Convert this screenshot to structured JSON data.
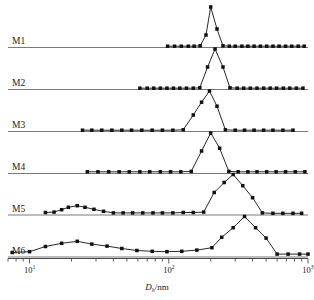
{
  "chart_data": {
    "type": "line",
    "title": "",
    "subtitle": "",
    "xlabel": "D_h/nm",
    "xlabel_base": "D",
    "xlabel_sub": "h",
    "xlabel_unit": "/nm",
    "ylabel": "",
    "xscale": "log",
    "xlim": [
      7,
      1000
    ],
    "grid": false,
    "legend": "none",
    "legend_position": "left-row-labels",
    "marker": "filled-square",
    "line_color": "#111111",
    "baseline_color": "#7a7a7a",
    "axis_color": "#4a4a4a",
    "xticks_major": [
      10,
      100,
      1000
    ],
    "xtick_labels": [
      "10¹",
      "10²",
      "10³"
    ],
    "xtick_label_bases": [
      "10",
      "10",
      "10"
    ],
    "xtick_label_exponents": [
      "1",
      "2",
      "3"
    ],
    "series": [
      {
        "name": "M1",
        "x": [
          98,
          110,
          123,
          138,
          152,
          168,
          185,
          200,
          222,
          245,
          272,
          300,
          335,
          370,
          410,
          455,
          505,
          560,
          620,
          690,
          765,
          850,
          940
        ],
        "values": [
          0.02,
          0.02,
          0.02,
          0.02,
          0.02,
          0.03,
          0.3,
          1.0,
          0.45,
          0.03,
          0.02,
          0.02,
          0.02,
          0.02,
          0.02,
          0.02,
          0.02,
          0.02,
          0.02,
          0.02,
          0.02,
          0.02,
          0.02
        ]
      },
      {
        "name": "M2",
        "x": [
          62,
          70,
          78,
          87,
          97,
          108,
          120,
          134,
          150,
          167,
          190,
          215,
          245,
          275,
          310,
          345,
          385,
          430,
          480,
          535,
          595,
          665,
          740,
          825,
          920
        ],
        "values": [
          0.02,
          0.02,
          0.02,
          0.02,
          0.02,
          0.02,
          0.02,
          0.02,
          0.02,
          0.03,
          0.55,
          1.0,
          0.55,
          0.03,
          0.02,
          0.02,
          0.02,
          0.02,
          0.02,
          0.02,
          0.02,
          0.02,
          0.02,
          0.02,
          0.02
        ]
      },
      {
        "name": "M3",
        "x": [
          24,
          28,
          33,
          39,
          46,
          54,
          64,
          76,
          90,
          107,
          127,
          150,
          172,
          196,
          222,
          255,
          300,
          350,
          410,
          480,
          560,
          660,
          780
        ],
        "values": [
          0.02,
          0.02,
          0.02,
          0.02,
          0.02,
          0.02,
          0.02,
          0.02,
          0.02,
          0.02,
          0.03,
          0.4,
          0.72,
          1.0,
          0.62,
          0.03,
          0.02,
          0.02,
          0.02,
          0.02,
          0.02,
          0.02,
          0.02
        ]
      },
      {
        "name": "M4",
        "x": [
          26,
          31,
          37,
          44,
          52,
          62,
          73,
          87,
          103,
          122,
          145,
          172,
          200,
          232,
          270,
          315,
          370,
          430,
          505,
          590,
          690,
          810,
          950
        ],
        "values": [
          0.03,
          0.03,
          0.03,
          0.03,
          0.03,
          0.03,
          0.03,
          0.03,
          0.03,
          0.03,
          0.04,
          0.55,
          1.0,
          0.62,
          0.04,
          0.03,
          0.03,
          0.03,
          0.03,
          0.03,
          0.03,
          0.03,
          0.03
        ]
      },
      {
        "name": "M5",
        "x": [
          13,
          15,
          17,
          19,
          22,
          25,
          29,
          34,
          40,
          47,
          55,
          65,
          77,
          90,
          107,
          127,
          150,
          178,
          212,
          250,
          290,
          340,
          400,
          470,
          560,
          660,
          780,
          900
        ],
        "values": [
          0.05,
          0.06,
          0.12,
          0.18,
          0.22,
          0.18,
          0.13,
          0.08,
          0.04,
          0.04,
          0.04,
          0.04,
          0.04,
          0.04,
          0.04,
          0.05,
          0.05,
          0.06,
          0.55,
          0.8,
          1.0,
          0.72,
          0.42,
          0.04,
          0.03,
          0.03,
          0.03,
          0.03
        ]
      },
      {
        "name": "M6",
        "x": [
          7.5,
          10,
          13,
          17,
          22,
          28,
          36,
          46,
          59,
          76,
          97,
          124,
          159,
          204,
          240,
          290,
          350,
          420,
          500,
          600,
          720,
          870,
          1000
        ],
        "values": [
          0.1,
          0.12,
          0.25,
          0.33,
          0.38,
          0.31,
          0.26,
          0.2,
          0.15,
          0.13,
          0.12,
          0.13,
          0.16,
          0.22,
          0.48,
          0.72,
          1.0,
          0.72,
          0.46,
          0.06,
          0.06,
          0.06,
          0.06
        ]
      }
    ]
  },
  "axis": {
    "title_base": "D",
    "title_sub": "h",
    "title_unit": "/nm"
  },
  "row_labels": [
    "M1",
    "M2",
    "M3",
    "M4",
    "M5",
    "M6"
  ]
}
